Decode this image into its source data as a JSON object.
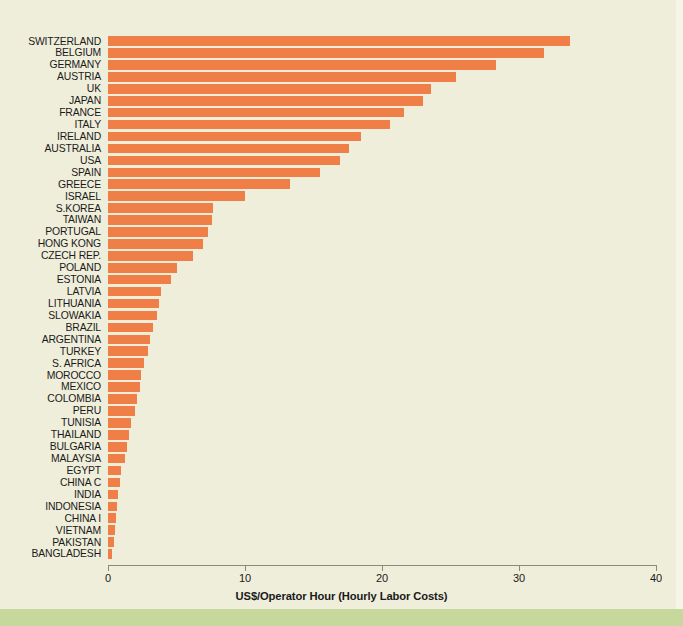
{
  "chart_data": {
    "type": "bar",
    "orientation": "horizontal",
    "title": "",
    "subtitle": "",
    "xlabel": "US$/Operator Hour (Hourly Labor Costs)",
    "ylabel": "",
    "xlim": [
      0,
      40
    ],
    "xticks": [
      0,
      10,
      20,
      30,
      40
    ],
    "xtick_labels": [
      "0",
      "10",
      "20",
      "30",
      "40"
    ],
    "grid": false,
    "legend": null,
    "bar_color": "#ef7f46",
    "background_color": "#efeedb",
    "accent_band_color": "#c6d89b",
    "categories": [
      "SWITZERLAND",
      "BELGIUM",
      "GERMANY",
      "AUSTRIA",
      "UK",
      "JAPAN",
      "FRANCE",
      "ITALY",
      "IRELAND",
      "AUSTRALIA",
      "USA",
      "SPAIN",
      "GREECE",
      "ISRAEL",
      "S.KOREA",
      "TAIWAN",
      "PORTUGAL",
      "HONG KONG",
      "CZECH REP.",
      "POLAND",
      "ESTONIA",
      "LATVIA",
      "LITHUANIA",
      "SLOWAKIA",
      "BRAZIL",
      "ARGENTINA",
      "TURKEY",
      "S. AFRICA",
      "MOROCCO",
      "MEXICO",
      "COLOMBIA",
      "PERU",
      "TUNISIA",
      "THAILAND",
      "BULGARIA",
      "MALAYSIA",
      "EGYPT",
      "CHINA C",
      "INDIA",
      "INDONESIA",
      "CHINA I",
      "VIETNAM",
      "PAKISTAN",
      "BANGLADESH"
    ],
    "values": [
      33.7,
      31.8,
      28.3,
      25.4,
      23.6,
      23.0,
      21.6,
      20.6,
      18.5,
      17.6,
      16.9,
      15.5,
      13.3,
      10.0,
      7.7,
      7.6,
      7.3,
      6.9,
      6.2,
      5.0,
      4.6,
      3.9,
      3.7,
      3.6,
      3.3,
      3.1,
      2.9,
      2.6,
      2.4,
      2.3,
      2.1,
      2.0,
      1.7,
      1.5,
      1.4,
      1.25,
      0.95,
      0.85,
      0.75,
      0.68,
      0.62,
      0.52,
      0.45,
      0.32
    ]
  }
}
